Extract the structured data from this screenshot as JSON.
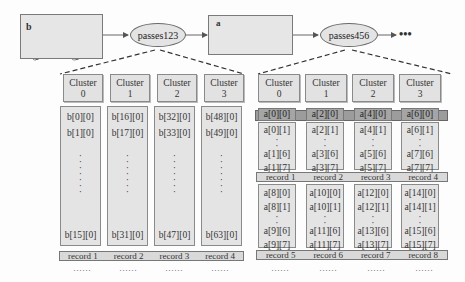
{
  "flow": {
    "box_b": {
      "label": "b"
    },
    "pass1": {
      "label": "passes123"
    },
    "box_a": {
      "label": "a"
    },
    "pass2": {
      "label": "passes456"
    },
    "more": {
      "label": "•••"
    }
  },
  "left_group": {
    "clusters": [
      {
        "title": "Cluster",
        "index": "0"
      },
      {
        "title": "Cluster",
        "index": "1"
      },
      {
        "title": "Cluster",
        "index": "2"
      },
      {
        "title": "Cluster",
        "index": "3"
      }
    ],
    "columns": [
      {
        "top1": "b[0][0]",
        "top2": "b[1][0]",
        "bottom": "b[15][0]"
      },
      {
        "top1": "b[16][0]",
        "top2": "b[17][0]",
        "bottom": "b[31][0]"
      },
      {
        "top1": "b[32][0]",
        "top2": "b[33][0]",
        "bottom": "b[47][0]"
      },
      {
        "top1": "b[48][0]",
        "top2": "b[49][0]",
        "bottom": "b[63][0]"
      }
    ],
    "records": [
      "record 1",
      "record 2",
      "record 3",
      "record 4"
    ],
    "ellipsis": "……"
  },
  "right_group": {
    "clusters": [
      {
        "title": "Cluster",
        "index": "0"
      },
      {
        "title": "Cluster",
        "index": "1"
      },
      {
        "title": "Cluster",
        "index": "2"
      },
      {
        "title": "Cluster",
        "index": "3"
      }
    ],
    "header_cells": [
      "a[0][0]",
      "a[2][0]",
      "a[4][0]",
      "a[6][0]"
    ],
    "upper_columns": [
      {
        "r1": "a[0][1]",
        "r2": "a[1][6]",
        "r3": "a[1][7]"
      },
      {
        "r1": "a[2][1]",
        "r2": "a[3][6]",
        "r3": "a[3][7]"
      },
      {
        "r1": "a[4][1]",
        "r2": "a[5][6]",
        "r3": "a[5][7]"
      },
      {
        "r1": "a[6][1]",
        "r2": "a[7][6]",
        "r3": "a[7][7]"
      }
    ],
    "records_upper": [
      "record 1",
      "record 2",
      "record 3",
      "record 4"
    ],
    "lower_columns": [
      {
        "r0": "a[8][0]",
        "r1": "a[8][1]",
        "r2": "a[9][6]",
        "r3": "a[9][7]"
      },
      {
        "r0": "a[10][0]",
        "r1": "a[10][1]",
        "r2": "a[11][6]",
        "r3": "a[11][7]"
      },
      {
        "r0": "a[12][0]",
        "r1": "a[12][1]",
        "r2": "a[13][6]",
        "r3": "a[13][7]"
      },
      {
        "r0": "a[14][0]",
        "r1": "a[14][1]",
        "r2": "a[15][6]",
        "r3": "a[15][7]"
      }
    ],
    "records_lower": [
      "record 5",
      "record 6",
      "record 7",
      "record 8"
    ],
    "ellipsis": "……"
  },
  "colors": {
    "panel": "#e6e6e6",
    "border": "#7a7a7a",
    "dark_row": "#9c9c9c",
    "line": "#555555"
  }
}
